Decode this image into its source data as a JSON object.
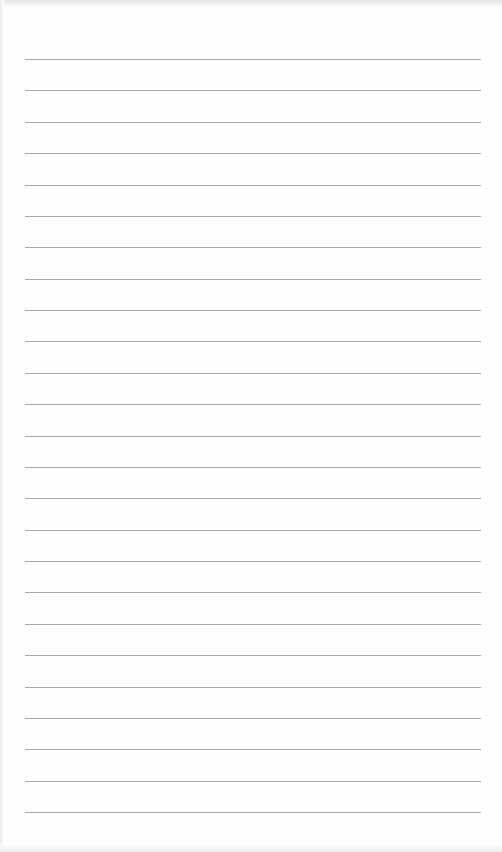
{
  "page": {
    "type": "lined-paper",
    "line_count": 25,
    "line_color": "#a8a8a8",
    "background_color": "#fefefe"
  }
}
